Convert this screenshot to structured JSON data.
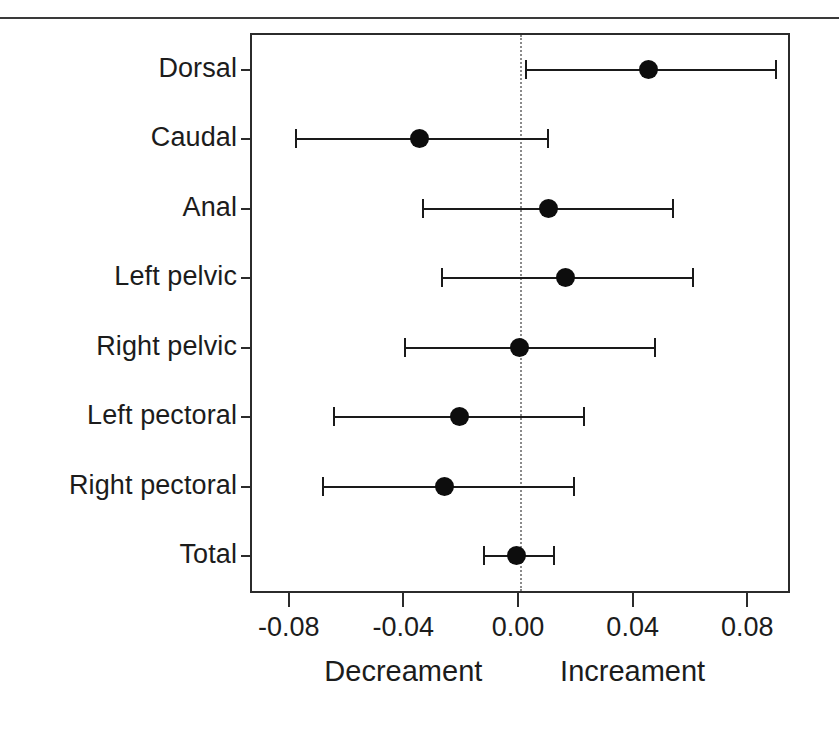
{
  "chart_data": {
    "type": "scatter",
    "title": "",
    "subtitle": "",
    "xlabel": "",
    "ylabel": "",
    "xlim": [
      -0.0935,
      0.0935
    ],
    "grid": false,
    "legend": "none",
    "orientation": "horizontal",
    "zero_reference_line": 0.0,
    "xticks": [
      -0.08,
      -0.04,
      0.0,
      0.04,
      0.08
    ],
    "xtick_labels": [
      "-0.08",
      "-0.04",
      "0.00",
      "0.04",
      "0.08"
    ],
    "categories": [
      "Dorsal",
      "Caudal",
      "Anal",
      "Left pelvic",
      "Right pelvic",
      "Left pectoral",
      "Right pectoral",
      "Total"
    ],
    "values": [
      0.045,
      -0.035,
      0.01,
      0.016,
      0.0,
      -0.021,
      -0.026,
      -0.001
    ],
    "ci_low": [
      0.0016,
      -0.0785,
      -0.0341,
      -0.0276,
      -0.0406,
      -0.0652,
      -0.0691,
      -0.013
    ],
    "ci_high": [
      0.089,
      0.0094,
      0.0532,
      0.06,
      0.0467,
      0.0221,
      0.0185,
      0.0114
    ],
    "points": [
      {
        "category": "Dorsal",
        "value": 0.045,
        "ci_low": 0.0016,
        "ci_high": 0.089
      },
      {
        "category": "Caudal",
        "value": -0.035,
        "ci_low": -0.0785,
        "ci_high": 0.0094
      },
      {
        "category": "Anal",
        "value": 0.01,
        "ci_low": -0.0341,
        "ci_high": 0.0532
      },
      {
        "category": "Left pelvic",
        "value": 0.016,
        "ci_low": -0.0276,
        "ci_high": 0.06
      },
      {
        "category": "Right pelvic",
        "value": 0.0,
        "ci_low": -0.0406,
        "ci_high": 0.0467
      },
      {
        "category": "Left pectoral",
        "value": -0.021,
        "ci_low": -0.0652,
        "ci_high": 0.0221
      },
      {
        "category": "Right pectoral",
        "value": -0.026,
        "ci_low": -0.0691,
        "ci_high": 0.0185
      },
      {
        "category": "Total",
        "value": -0.001,
        "ci_low": -0.013,
        "ci_high": 0.0114
      }
    ],
    "annotations": [
      {
        "name": "decrement-caption",
        "text": "Decreament",
        "x": -0.04
      },
      {
        "name": "increment-caption",
        "text": "Increament",
        "x": 0.04
      }
    ],
    "colors": {
      "point": "#0d0d0d",
      "line": "#1a1a1a",
      "axis": "#2b2b2b",
      "zero_line": "#8a8a8a",
      "text": "#1c1c1c",
      "background": "#ffffff"
    }
  }
}
